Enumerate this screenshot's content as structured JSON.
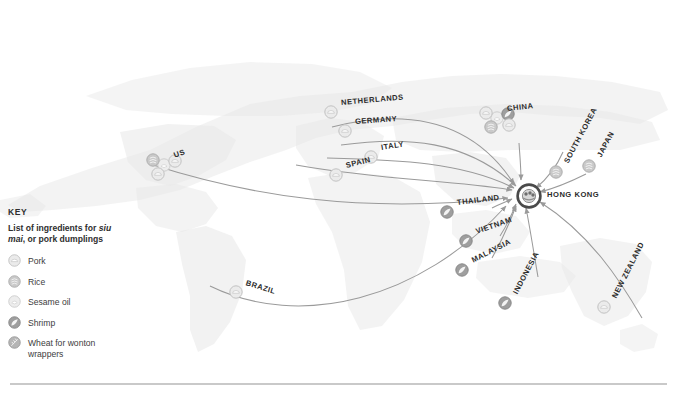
{
  "key": {
    "title": "KEY",
    "subtitle_pre": "List of ingredients for ",
    "subtitle_em": "siu mai",
    "subtitle_post": ", or pork dumplings",
    "items": [
      {
        "icon": "pork-icon",
        "label": "Pork"
      },
      {
        "icon": "rice-icon",
        "label": "Rice"
      },
      {
        "icon": "sesame-oil-icon",
        "label": "Sesame oil"
      },
      {
        "icon": "shrimp-icon",
        "label": "Shrimp"
      },
      {
        "icon": "wheat-icon",
        "label": "Wheat for wonton wrappers"
      }
    ]
  },
  "hub": {
    "label": "HONG KONG",
    "icon": "siu-mai-icon"
  },
  "colors": {
    "land": "#e7e7e7",
    "land_edge": "#dcdcdc",
    "flow": "#9a9a9a",
    "node_fill": "#ebebeb",
    "node_stroke": "#b4b4b4",
    "hub_ring": "#4a4a4a",
    "text": "#2b2b2b",
    "rule": "#c9c9c9"
  },
  "origins": [
    {
      "name": "US",
      "label": "US",
      "x": 164,
      "y": 165,
      "rot": -20,
      "ingredients": [
        "sesame-oil-icon",
        "rice-icon",
        "pork-icon",
        "pork-icon"
      ]
    },
    {
      "name": "BRAZIL",
      "label": "BRAZIL",
      "x": 236,
      "y": 292,
      "rot": 17,
      "ingredients": [
        "pork-icon"
      ]
    },
    {
      "name": "NETHERLANDS",
      "label": "NETHERLANDS",
      "x": 331,
      "y": 112,
      "rot": -5,
      "ingredients": [
        "pork-icon"
      ]
    },
    {
      "name": "GERMANY",
      "label": "GERMANY",
      "x": 345,
      "y": 131,
      "rot": -4,
      "ingredients": [
        "pork-icon"
      ]
    },
    {
      "name": "ITALY",
      "label": "ITALY",
      "x": 371,
      "y": 157,
      "rot": -9,
      "ingredients": [
        "pork-icon"
      ]
    },
    {
      "name": "SPAIN",
      "label": "SPAIN",
      "x": 336,
      "y": 175,
      "rot": -14,
      "ingredients": [
        "pork-icon"
      ]
    },
    {
      "name": "CHINA",
      "label": "CHINA",
      "x": 497,
      "y": 118,
      "rot": -6,
      "ingredients": [
        "sesame-oil-icon",
        "pork-icon",
        "shrimp-icon",
        "rice-icon",
        "pork-icon"
      ]
    },
    {
      "name": "SOUTH KOREA",
      "label": "SOUTH KOREA",
      "x": 556,
      "y": 172,
      "rot": -62,
      "ingredients": [
        "rice-icon"
      ]
    },
    {
      "name": "JAPAN",
      "label": "JAPAN",
      "x": 589,
      "y": 166,
      "rot": -62,
      "ingredients": [
        "rice-icon"
      ]
    },
    {
      "name": "THAILAND",
      "label": "THAILAND",
      "x": 447,
      "y": 212,
      "rot": -7,
      "ingredients": [
        "shrimp-icon"
      ]
    },
    {
      "name": "VIETNAM",
      "label": "VIETNAM",
      "x": 466,
      "y": 241,
      "rot": -19,
      "ingredients": [
        "shrimp-icon"
      ]
    },
    {
      "name": "MALAYSIA",
      "label": "MALAYSIA",
      "x": 462,
      "y": 270,
      "rot": -27,
      "ingredients": [
        "shrimp-icon"
      ]
    },
    {
      "name": "INDONESIA",
      "label": "INDONESIA",
      "x": 505,
      "y": 303,
      "rot": -62,
      "ingredients": [
        "shrimp-icon"
      ]
    },
    {
      "name": "NEW ZEALAND",
      "label": "NEW ZEALAND",
      "x": 604,
      "y": 307,
      "rot": -63,
      "ingredients": [
        "pork-icon"
      ]
    }
  ]
}
